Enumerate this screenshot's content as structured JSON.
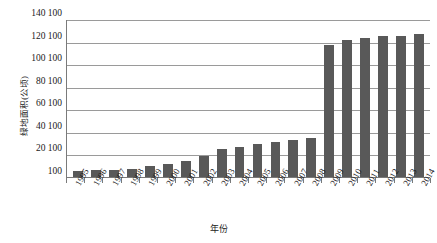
{
  "chart_data": {
    "type": "bar",
    "title": "",
    "xlabel": "年份",
    "ylabel": "绿地面积(公顷)",
    "categories": [
      "1995",
      "1996",
      "1997",
      "1998",
      "1999",
      "2000",
      "2001",
      "2002",
      "2003",
      "2004",
      "2005",
      "2006",
      "2007",
      "2008",
      "2009",
      "2010",
      "2011",
      "2012",
      "2013",
      "2014"
    ],
    "values": [
      5,
      6,
      6.5,
      7.5,
      10,
      11.5,
      14,
      19,
      25,
      27,
      29,
      31,
      32.5,
      35,
      117,
      121,
      123,
      125,
      125,
      127
    ],
    "series": [
      {
        "name": "绿地面积(公顷)",
        "values": [
          5,
          6,
          6.5,
          7.5,
          10,
          11.5,
          14,
          19,
          25,
          27,
          29,
          31,
          32.5,
          35,
          117,
          121,
          123,
          125,
          125,
          127
        ]
      }
    ],
    "ylim": [
      0,
      140
    ],
    "ytick_values": [
      0,
      20,
      40,
      60,
      80,
      100,
      120,
      140
    ],
    "ytick_labels": [
      "100",
      "20 100",
      "40 100",
      "60 100",
      "80 100",
      "100 100",
      "120 100",
      "140 100"
    ],
    "grid": true,
    "legend": "none",
    "bar_color": "#595959",
    "gridline_color": "#9a9a9a",
    "axis_color": "#7a7a7a",
    "background": "#ffffff"
  }
}
